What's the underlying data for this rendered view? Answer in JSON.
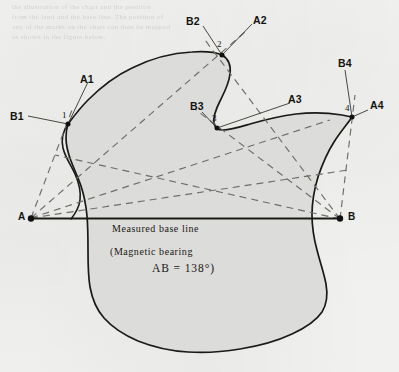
{
  "figure": {
    "kind": "plane-table triangulation survey of an island",
    "background_color": "#f1f1ef",
    "land_fill_color": "#dcdcdb",
    "coastline_color": "#1a1a16",
    "ray_color": "#6e6e68",
    "baseline_color": "#1a1a16",
    "ghost_text": [
      "the illustration of the chart and the position",
      "from the land and the base line. The position of",
      "any of the marks on the chart can then be mapped",
      "as shown in the figure below."
    ]
  },
  "baseline": {
    "label": "Measured base line",
    "note_open": "(Magnetic bearing",
    "note_value": "AB = 138°)",
    "endpoint_left": "A",
    "endpoint_right": "B",
    "bearing_degrees": 138
  },
  "stations": [
    {
      "number": "1",
      "ray_from_a": "A1",
      "ray_from_b": "B1"
    },
    {
      "number": "2",
      "ray_from_a": "A2",
      "ray_from_b": "B2"
    },
    {
      "number": "3",
      "ray_from_a": "A3",
      "ray_from_b": "B3"
    },
    {
      "number": "4",
      "ray_from_a": "A4",
      "ray_from_b": "B4"
    }
  ]
}
